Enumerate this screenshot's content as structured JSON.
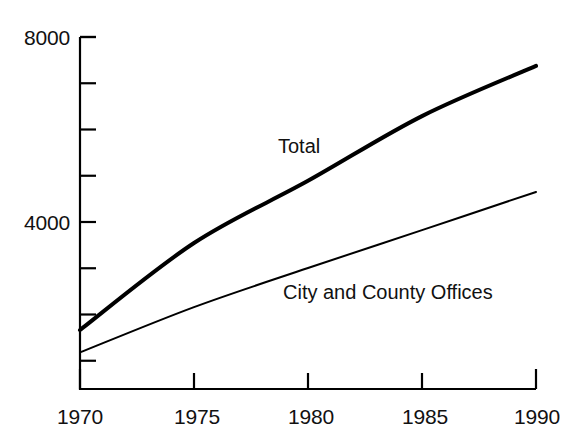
{
  "chart_data": {
    "type": "line",
    "title": "",
    "subtitle": "",
    "xlabel": "",
    "ylabel": "",
    "x": [
      1970,
      1975,
      1980,
      1985,
      1990
    ],
    "xlim": [
      1970,
      1990
    ],
    "ylim": [
      0,
      8000
    ],
    "grid": false,
    "legend_position": "inline-annotation",
    "y_major_ticks": [
      4000,
      8000
    ],
    "y_major_tick_labels": [
      "4000",
      "8000"
    ],
    "y_minor_ticks": [
      1000,
      2000,
      3000,
      5000,
      6000,
      7000
    ],
    "x_tick_labels": [
      "1970",
      "1975",
      "1980",
      "1985",
      "1990"
    ],
    "series": [
      {
        "name": "Total",
        "values": [
          1665,
          3545,
          4890,
          6290,
          7375
        ],
        "line_width": 4,
        "color": "#000000"
      },
      {
        "name": "City and County Offices",
        "values": [
          1180,
          2160,
          3005,
          3825,
          4650
        ],
        "line_width": 2,
        "color": "#000000"
      }
    ],
    "annotations": [
      {
        "text": "Total",
        "x": 1981,
        "y": 5750
      },
      {
        "text": "City and County Offices",
        "x": 1981,
        "y": 2800
      }
    ]
  },
  "axes": {
    "y_labels": [
      {
        "text": "8000",
        "value": 8000
      },
      {
        "text": "4000",
        "value": 4000
      }
    ],
    "x_labels": [
      {
        "text": "1970",
        "value": 1970
      },
      {
        "text": "1975",
        "value": 1975
      },
      {
        "text": "1980",
        "value": 1980
      },
      {
        "text": "1985",
        "value": 1985
      },
      {
        "text": "1990",
        "value": 1990
      }
    ]
  },
  "annotations": {
    "total_label": "Total",
    "city_county_label": "City and County Offices"
  },
  "style": {
    "axis_color": "#000000",
    "background": "#ffffff",
    "text_color": "#111111"
  }
}
